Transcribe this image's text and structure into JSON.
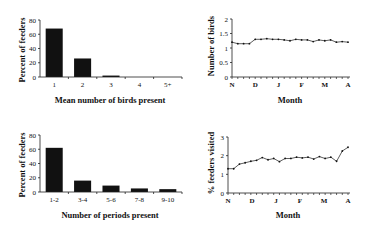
{
  "chart_data": [
    {
      "type": "bar",
      "position": "top-left",
      "title": "",
      "categories": [
        "1",
        "2",
        "3",
        "4",
        "5+"
      ],
      "values": [
        68,
        26,
        2,
        0,
        0
      ],
      "xlabel": "Mean number of birds present",
      "ylabel": "Percent of feeders",
      "ylim": [
        0,
        80
      ],
      "yticks": [
        "0",
        "20",
        "40",
        "60",
        "80"
      ],
      "grid": false,
      "bar_color": "#111111"
    },
    {
      "type": "line",
      "position": "top-right",
      "title": "",
      "x": [
        0,
        1,
        2,
        3,
        4,
        5,
        6,
        7,
        8,
        9,
        10,
        11,
        12,
        13,
        14,
        15,
        16,
        17,
        18,
        19,
        20
      ],
      "values": [
        1.2,
        1.15,
        1.15,
        1.15,
        1.3,
        1.3,
        1.32,
        1.3,
        1.3,
        1.28,
        1.25,
        1.3,
        1.28,
        1.28,
        1.22,
        1.28,
        1.25,
        1.28,
        1.2,
        1.22,
        1.2
      ],
      "xlabel": "Month",
      "ylabel": "Number of birds",
      "xticks": [
        "N",
        "D",
        "J",
        "F",
        "M",
        "A"
      ],
      "ylim": [
        0,
        2
      ],
      "yticks": [
        "0",
        "0.5",
        "1",
        "1.5",
        "2"
      ],
      "grid": false,
      "line_color": "#333333"
    },
    {
      "type": "bar",
      "position": "bottom-left",
      "title": "",
      "categories": [
        "1-2",
        "3-4",
        "5-6",
        "7-8",
        "9-10"
      ],
      "values": [
        62,
        16,
        9,
        5,
        4
      ],
      "xlabel": "Number of periods present",
      "ylabel": "Percent of feeders",
      "ylim": [
        0,
        80
      ],
      "yticks": [
        "0",
        "20",
        "40",
        "60",
        "80"
      ],
      "grid": false,
      "bar_color": "#111111"
    },
    {
      "type": "line",
      "position": "bottom-right",
      "title": "",
      "x": [
        0,
        1,
        2,
        3,
        4,
        5,
        6,
        7,
        8,
        9,
        10,
        11,
        12,
        13,
        14,
        15,
        16,
        17,
        18,
        19,
        20,
        21
      ],
      "values": [
        1.3,
        1.3,
        1.55,
        1.62,
        1.7,
        1.75,
        1.9,
        1.78,
        1.85,
        1.68,
        1.85,
        1.85,
        1.92,
        1.88,
        1.92,
        1.82,
        1.95,
        1.85,
        1.92,
        1.7,
        2.25,
        2.45
      ],
      "xlabel": "Month",
      "ylabel": "% feeders visited",
      "xticks": [
        "N",
        "D",
        "J",
        "F",
        "M",
        "A"
      ],
      "ylim": [
        0,
        3
      ],
      "yticks": [
        "0",
        "1",
        "2",
        "3"
      ],
      "grid": false,
      "line_color": "#333333"
    }
  ]
}
